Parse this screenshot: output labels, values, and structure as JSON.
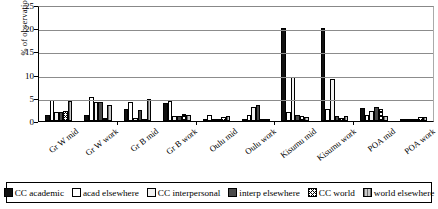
{
  "chart_data": {
    "type": "bar",
    "title": "",
    "xlabel": "",
    "ylabel": "% of observations",
    "ylim": [
      0,
      25
    ],
    "yticks": [
      0,
      5,
      10,
      15,
      20,
      25
    ],
    "grid": true,
    "legend_position": "bottom",
    "categories": [
      "Gr W mid",
      "Gr W work",
      "Gr B mid",
      "Gr B work",
      "Oulu mid",
      "Oulu work",
      "Kisumu mid",
      "Kisumu work",
      "POA mid",
      "POA work"
    ],
    "series": [
      {
        "name": "CC academic",
        "swatch": "black",
        "values": [
          1.2,
          1.4,
          2.5,
          3.9,
          0.2,
          0.3,
          20.0,
          20.0,
          2.9,
          0.4
        ]
      },
      {
        "name": "acad elsewhere",
        "swatch": "white",
        "values": [
          4.5,
          5.2,
          4.1,
          4.3,
          1.3,
          1.2,
          2.0,
          2.5,
          1.3,
          0.5
        ]
      },
      {
        "name": "CC interpersonal",
        "swatch": "light",
        "values": [
          2.0,
          4.0,
          0.6,
          1.1,
          0.3,
          3.0,
          9.5,
          9.0,
          2.1,
          0.2
        ]
      },
      {
        "name": "interp elsewhere",
        "swatch": "dark-gray",
        "values": [
          2.0,
          4.0,
          2.4,
          1.0,
          0.5,
          3.4,
          1.2,
          1.0,
          3.1,
          0.3
        ]
      },
      {
        "name": "CC world",
        "swatch": "crosshatch",
        "values": [
          2.1,
          0.6,
          0.5,
          1.6,
          0.9,
          0.3,
          1.0,
          0.7,
          2.6,
          0.9
        ]
      },
      {
        "name": "world elsewhere",
        "swatch": "light-gray-vert",
        "values": [
          4.4,
          3.5,
          4.7,
          1.2,
          1.1,
          0.4,
          0.8,
          1.1,
          1.0,
          0.9
        ]
      }
    ]
  }
}
